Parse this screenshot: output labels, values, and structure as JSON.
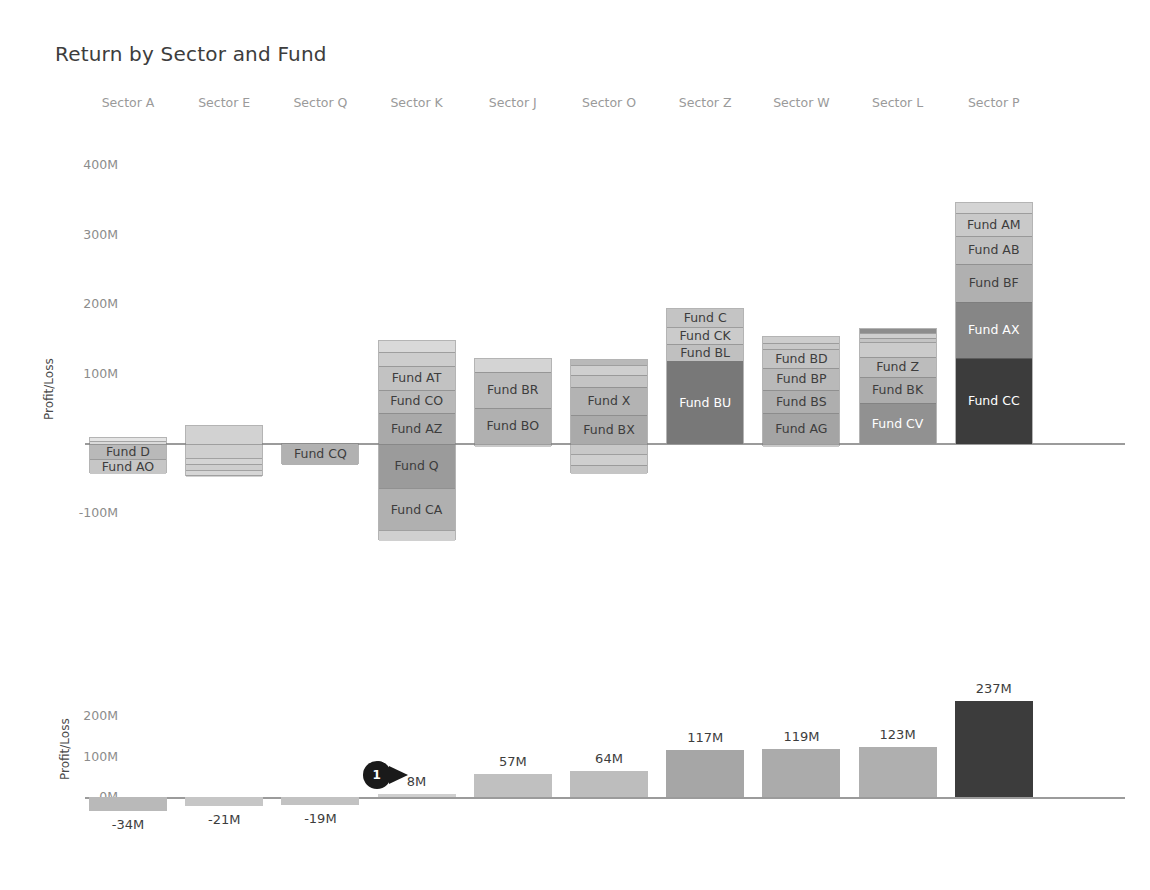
{
  "title": "Return by Sector and Fund",
  "palette": {
    "lightest": "#e4e4e4",
    "lighter": "#d2d2d2",
    "light": "#c6c6c6",
    "mid_light": "#b9b9b9",
    "mid": "#ababab",
    "mid_dark": "#9a9a9a",
    "dark": "#8a8a8a",
    "darker": "#6f6f6f",
    "darkest": "#3c3c3c",
    "near_black": "#2f2f2f",
    "axis": "#9b9b9b",
    "label_dark": "#3d3d3d",
    "label_light": "#ffffff",
    "tick": "#8c8c8c",
    "header": "#9a9a9a"
  },
  "sectors": [
    "Sector A",
    "Sector E",
    "Sector Q",
    "Sector K",
    "Sector J",
    "Sector O",
    "Sector Z",
    "Sector W",
    "Sector L",
    "Sector P"
  ],
  "top_chart": {
    "ylabel": "Profit/Loss",
    "yticks": [
      "400M",
      "300M",
      "200M",
      "100M",
      "0M",
      "-100M"
    ]
  },
  "bottom_chart": {
    "ylabel": "Profit/Loss",
    "yticks": [
      "200M",
      "100M",
      "0M"
    ]
  },
  "annotation": {
    "label": "1"
  },
  "chart_data": [
    {
      "type": "bar",
      "id": "stacked-waterfall",
      "title": "Return by Sector and Fund",
      "subtype": "stacked",
      "xlabel": "",
      "ylabel": "Profit/Loss",
      "ylim": [
        -140,
        440
      ],
      "yticks": [
        400,
        300,
        200,
        100,
        0,
        -100
      ],
      "ytick_labels": [
        "400M",
        "300M",
        "200M",
        "100M",
        "0M",
        "-100M"
      ],
      "grid": false,
      "legend": "none",
      "categories": [
        "Sector A",
        "Sector E",
        "Sector Q",
        "Sector K",
        "Sector J",
        "Sector O",
        "Sector Z",
        "Sector W",
        "Sector L",
        "Sector P"
      ],
      "totals": [
        -34,
        -21,
        -19,
        8,
        57,
        64,
        117,
        119,
        123,
        237
      ],
      "stacks": [
        {
          "category": "Sector A",
          "segments": [
            {
              "label": "",
              "value": 4,
              "color": "#e4e4e4",
              "show_label": false
            },
            {
              "label": "",
              "value": 5,
              "color": "#dadada",
              "show_label": false
            },
            {
              "label": "Fund D",
              "value": -22,
              "color": "#b9b9b9",
              "show_label": true
            },
            {
              "label": "Fund AO",
              "value": -21,
              "color": "#c6c6c6",
              "show_label": true
            }
          ]
        },
        {
          "category": "Sector E",
          "segments": [
            {
              "label": "",
              "value": 26,
              "color": "#d2d2d2",
              "show_label": false
            },
            {
              "label": "",
              "value": -20,
              "color": "#cfcfcf",
              "show_label": false
            },
            {
              "label": "",
              "value": -9,
              "color": "#d4d4d4",
              "show_label": false
            },
            {
              "label": "",
              "value": -9,
              "color": "#cecece",
              "show_label": false
            },
            {
              "label": "",
              "value": -6,
              "color": "#d6d6d6",
              "show_label": false
            },
            {
              "label": "",
              "value": -3,
              "color": "#d1d1d1",
              "show_label": false
            }
          ]
        },
        {
          "category": "Sector Q",
          "segments": [
            {
              "label": "Fund CQ",
              "value": -30,
              "color": "#b1b1b1",
              "show_label": true
            }
          ]
        },
        {
          "category": "Sector K",
          "segments": [
            {
              "label": "",
              "value": 16,
              "color": "#d9d9d9",
              "show_label": false
            },
            {
              "label": "",
              "value": 20,
              "color": "#cdcdcd",
              "show_label": false
            },
            {
              "label": "Fund AT",
              "value": 34,
              "color": "#c2c2c2",
              "show_label": true
            },
            {
              "label": "Fund CO",
              "value": 33,
              "color": "#b8b8b8",
              "show_label": true
            },
            {
              "label": "Fund AZ",
              "value": 45,
              "color": "#a9a9a9",
              "show_label": true
            },
            {
              "label": "Fund Q",
              "value": -64,
              "color": "#9b9b9b",
              "show_label": true
            },
            {
              "label": "Fund CA",
              "value": -60,
              "color": "#b0b0b0",
              "show_label": true
            },
            {
              "label": "",
              "value": -16,
              "color": "#d0d0d0",
              "show_label": false
            }
          ]
        },
        {
          "category": "Sector J",
          "segments": [
            {
              "label": "",
              "value": 18,
              "color": "#d4d4d4",
              "show_label": false
            },
            {
              "label": "Fund BR",
              "value": 52,
              "color": "#bbbbbb",
              "show_label": true
            },
            {
              "label": "Fund BO",
              "value": 52,
              "color": "#b0b0b0",
              "show_label": true
            },
            {
              "label": "",
              "value": -5,
              "color": "#c9c9c9",
              "show_label": false
            }
          ]
        },
        {
          "category": "Sector O",
          "segments": [
            {
              "label": "",
              "value": 8,
              "color": "#b9b9b9",
              "show_label": false
            },
            {
              "label": "",
              "value": 14,
              "color": "#cfcfcf",
              "show_label": false
            },
            {
              "label": "",
              "value": 17,
              "color": "#c4c4c4",
              "show_label": false
            },
            {
              "label": "Fund X",
              "value": 40,
              "color": "#b3b3b3",
              "show_label": true
            },
            {
              "label": "Fund BX",
              "value": 42,
              "color": "#aaaaaa",
              "show_label": true
            },
            {
              "label": "",
              "value": -14,
              "color": "#c8c8c8",
              "show_label": false
            },
            {
              "label": "",
              "value": -16,
              "color": "#cfcfcf",
              "show_label": false
            },
            {
              "label": "",
              "value": -13,
              "color": "#c5c5c5",
              "show_label": false
            }
          ]
        },
        {
          "category": "Sector Z",
          "segments": [
            {
              "label": "Fund C",
              "value": 26,
              "color": "#c4c4c4",
              "show_label": true
            },
            {
              "label": "Fund CK",
              "value": 24,
              "color": "#cbcbcb",
              "show_label": true
            },
            {
              "label": "Fund BL",
              "value": 25,
              "color": "#c0c0c0",
              "show_label": true
            },
            {
              "label": "Fund BU",
              "value": 119,
              "color": "#787878",
              "show_label": true
            }
          ]
        },
        {
          "category": "Sector W",
          "segments": [
            {
              "label": "",
              "value": 9,
              "color": "#cdcdcd",
              "show_label": false
            },
            {
              "label": "",
              "value": 9,
              "color": "#c8c8c8",
              "show_label": false
            },
            {
              "label": "Fund BD",
              "value": 27,
              "color": "#c3c3c3",
              "show_label": true
            },
            {
              "label": "Fund BP",
              "value": 31,
              "color": "#b9b9b9",
              "show_label": true
            },
            {
              "label": "Fund BS",
              "value": 34,
              "color": "#aeaeae",
              "show_label": true
            },
            {
              "label": "Fund AG",
              "value": 44,
              "color": "#a4a4a4",
              "show_label": true
            },
            {
              "label": "",
              "value": -5,
              "color": "#c9c9c9",
              "show_label": false
            }
          ]
        },
        {
          "category": "Sector L",
          "segments": [
            {
              "label": "",
              "value": 6,
              "color": "#8d8d8d",
              "show_label": false
            },
            {
              "label": "",
              "value": 6,
              "color": "#cfcfcf",
              "show_label": false
            },
            {
              "label": "",
              "value": 6,
              "color": "#c4c4c4",
              "show_label": false
            },
            {
              "label": "",
              "value": 22,
              "color": "#cbcbcb",
              "show_label": false
            },
            {
              "label": "Fund Z",
              "value": 28,
              "color": "#bcbcbc",
              "show_label": true
            },
            {
              "label": "Fund BK",
              "value": 38,
              "color": "#adadad",
              "show_label": true
            },
            {
              "label": "Fund CV",
              "value": 59,
              "color": "#919191",
              "show_label": true
            }
          ]
        },
        {
          "category": "Sector P",
          "segments": [
            {
              "label": "",
              "value": 14,
              "color": "#d4d4d4",
              "show_label": false
            },
            {
              "label": "Fund AM",
              "value": 34,
              "color": "#c9c9c9",
              "show_label": true
            },
            {
              "label": "Fund AB",
              "value": 40,
              "color": "#c0c0c0",
              "show_label": true
            },
            {
              "label": "Fund BF",
              "value": 55,
              "color": "#b0b0b0",
              "show_label": true
            },
            {
              "label": "Fund AX",
              "value": 80,
              "color": "#868686",
              "show_label": true
            },
            {
              "label": "Fund CC",
              "value": 124,
              "color": "#3c3c3c",
              "show_label": true
            }
          ]
        }
      ]
    },
    {
      "type": "bar",
      "id": "sector-totals",
      "title": "",
      "xlabel": "",
      "ylabel": "Profit/Loss",
      "ylim": [
        -60,
        260
      ],
      "yticks": [
        200,
        100,
        0
      ],
      "ytick_labels": [
        "200M",
        "100M",
        "0M"
      ],
      "grid": false,
      "legend": "none",
      "categories": [
        "Sector A",
        "Sector E",
        "Sector Q",
        "Sector K",
        "Sector J",
        "Sector O",
        "Sector Z",
        "Sector W",
        "Sector L",
        "Sector P"
      ],
      "values": [
        -34,
        -21,
        -19,
        8,
        57,
        64,
        117,
        119,
        123,
        237
      ],
      "value_labels": [
        "-34M",
        "-21M",
        "-19M",
        "8M",
        "57M",
        "64M",
        "117M",
        "119M",
        "123M",
        "237M"
      ],
      "colors": [
        "#b9b9b9",
        "#c6c6c6",
        "#c2c2c2",
        "#cfcfcf",
        "#c0c0c0",
        "#bdbdbd",
        "#a6a6a6",
        "#ababab",
        "#afafaf",
        "#3c3c3c"
      ],
      "annotations": [
        {
          "label": "1",
          "target_category": "Sector K",
          "shape": "teardrop",
          "color": "#1a1a1a"
        }
      ]
    }
  ]
}
